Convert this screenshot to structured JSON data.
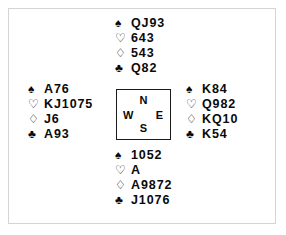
{
  "diagram": {
    "type": "bridge-deal-diagram",
    "suit_symbols": {
      "spades": "♠",
      "hearts": "♡",
      "diamonds": "♢",
      "clubs": "♣"
    },
    "compass": {
      "north": "N",
      "south": "S",
      "east": "E",
      "west": "W"
    },
    "hands": {
      "north": {
        "label": "North",
        "suits": [
          {
            "suit": "spades",
            "symbol": "♠",
            "ranks": "QJ93"
          },
          {
            "suit": "hearts",
            "symbol": "♡",
            "ranks": "643"
          },
          {
            "suit": "diamonds",
            "symbol": "♢",
            "ranks": "543"
          },
          {
            "suit": "clubs",
            "symbol": "♣",
            "ranks": "Q82"
          }
        ]
      },
      "west": {
        "label": "West",
        "suits": [
          {
            "suit": "spades",
            "symbol": "♠",
            "ranks": "A76"
          },
          {
            "suit": "hearts",
            "symbol": "♡",
            "ranks": "KJ1075"
          },
          {
            "suit": "diamonds",
            "symbol": "♢",
            "ranks": "J6"
          },
          {
            "suit": "clubs",
            "symbol": "♣",
            "ranks": "A93"
          }
        ]
      },
      "east": {
        "label": "East",
        "suits": [
          {
            "suit": "spades",
            "symbol": "♠",
            "ranks": "K84"
          },
          {
            "suit": "hearts",
            "symbol": "♡",
            "ranks": "Q982"
          },
          {
            "suit": "diamonds",
            "symbol": "♢",
            "ranks": "KQ10"
          },
          {
            "suit": "clubs",
            "symbol": "♣",
            "ranks": "K54"
          }
        ]
      },
      "south": {
        "label": "South",
        "suits": [
          {
            "suit": "spades",
            "symbol": "♠",
            "ranks": "1052"
          },
          {
            "suit": "hearts",
            "symbol": "♡",
            "ranks": "A"
          },
          {
            "suit": "diamonds",
            "symbol": "♢",
            "ranks": "A9872"
          },
          {
            "suit": "clubs",
            "symbol": "♣",
            "ranks": "J1076"
          }
        ]
      }
    },
    "colors": {
      "ink": "#0a0a0a",
      "frame": "#d4d4d4",
      "box_border": "#1a1a1a",
      "background": "#ffffff"
    }
  }
}
